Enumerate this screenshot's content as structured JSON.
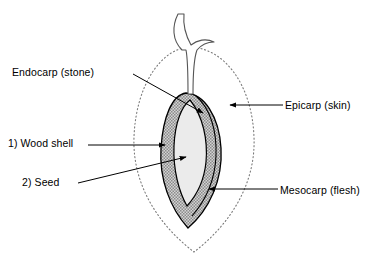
{
  "figure": {
    "background_color": "#ffffff",
    "ink_color": "#000000",
    "width": 370,
    "height": 270
  },
  "labels": {
    "endocarp": "Endocarp (stone)",
    "wood_shell": "1) Wood shell",
    "seed": "2) Seed",
    "epicarp": "Epicarp (skin)",
    "mesocarp": "Mesocarp (flesh)"
  },
  "structures": {
    "epicarp": {
      "name": "Epicarp (skin)",
      "style": "dotted outline",
      "fill": "#ffffff",
      "stroke": "#7a7a7a"
    },
    "mesocarp": {
      "name": "Mesocarp (flesh)",
      "style": "solid outline",
      "fill": "#ffffff",
      "stroke": "#000000"
    },
    "endocarp": {
      "name": "Endocarp (stone)",
      "style": "stippled hatch fill",
      "fill": "#c9c9c9",
      "stroke": "#000000"
    },
    "seed": {
      "name": "Seed",
      "style": "light grey fill",
      "fill": "#eaeaea",
      "stroke": "#000000"
    },
    "stem": {
      "name": "Stem / peduncle",
      "style": "outline only",
      "fill": "#ffffff",
      "stroke": "#555555"
    }
  },
  "leader_lines": [
    {
      "label": "Endocarp (stone)",
      "from": [
        133,
        74
      ],
      "to": [
        205,
        114
      ],
      "arrow": "end"
    },
    {
      "label": "1) Wood shell",
      "from": [
        88,
        145
      ],
      "to": [
        167,
        146
      ],
      "arrow": "end"
    },
    {
      "label": "2) Seed",
      "from": [
        80,
        183
      ],
      "to": [
        188,
        157
      ],
      "arrow": "end"
    },
    {
      "label": "Epicarp (skin)",
      "from": [
        283,
        105
      ],
      "to": [
        228,
        105
      ],
      "arrow": "end"
    },
    {
      "label": "Mesocarp (flesh)",
      "from": [
        278,
        189
      ],
      "to": [
        207,
        189
      ],
      "arrow": "end"
    }
  ]
}
